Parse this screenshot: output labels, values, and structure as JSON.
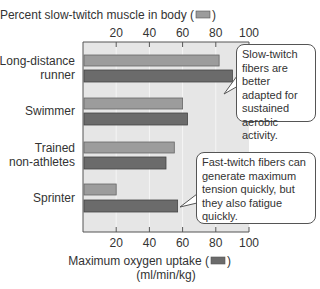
{
  "chart_data": {
    "type": "bar",
    "orientation": "horizontal",
    "categories": [
      "Long-distance runner",
      "Swimmer",
      "Trained non-athletes",
      "Sprinter"
    ],
    "category_lines": [
      [
        "Long-distance",
        "runner"
      ],
      [
        "Swimmer"
      ],
      [
        "Trained",
        "non-athletes"
      ],
      [
        "Sprinter"
      ]
    ],
    "series": [
      {
        "name": "Percent slow-twitch muscle in body",
        "axis": "top",
        "color": "#9c9c9c",
        "values": [
          82,
          60,
          55,
          20
        ]
      },
      {
        "name": "Maximum oxygen uptake (ml/min/kg)",
        "axis": "bottom",
        "color": "#6b6b6b",
        "values": [
          90,
          63,
          50,
          57
        ]
      }
    ],
    "top_axis": {
      "label": "Percent slow-twitch muscle in body (",
      "label_end": ")",
      "ticks": [
        20,
        40,
        60,
        80,
        100
      ],
      "range": [
        0,
        100
      ]
    },
    "bottom_axis": {
      "label_line1": "Maximum oxygen uptake (",
      "label_line1_end": ")",
      "label_line2": "(ml/min/kg)",
      "ticks": [
        20,
        40,
        60,
        80,
        100
      ],
      "range": [
        0,
        100
      ]
    },
    "plot_background": "#e6e6e6",
    "annotations": [
      {
        "text": "Slow-twitch fibers are better adapted for sustained aerobic activity.",
        "points_to": "Long-distance runner"
      },
      {
        "text": "Fast-twitch fibers can generate maximum tension quickly, but they also fatigue quickly.",
        "points_to": "Sprinter"
      }
    ],
    "grid": true,
    "legend": "inline in axis labels"
  }
}
